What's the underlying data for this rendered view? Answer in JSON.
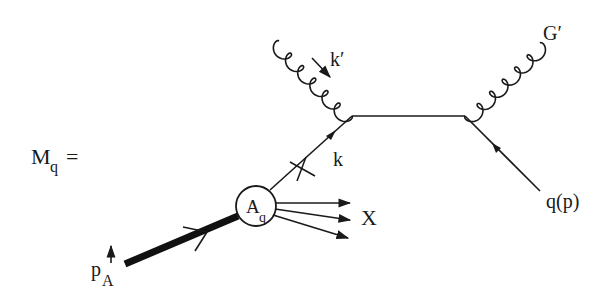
{
  "equation_label": {
    "symbol": "M",
    "subscript": "q",
    "equals": "="
  },
  "particles": {
    "incoming_gluon": {
      "label": "k",
      "prime": "′"
    },
    "outgoing_gluon": {
      "label": "G",
      "prime": "′"
    },
    "outgoing_quark": {
      "label": "q(p)"
    },
    "parton_line": {
      "label": "k"
    },
    "remnant": {
      "label": "X"
    },
    "incoming_hadron": {
      "label": "p",
      "subscript": "A"
    }
  },
  "blob": {
    "symbol": "A",
    "subscript": "q"
  },
  "colors": {
    "ink": "#1a1a1a",
    "background": "#ffffff"
  }
}
